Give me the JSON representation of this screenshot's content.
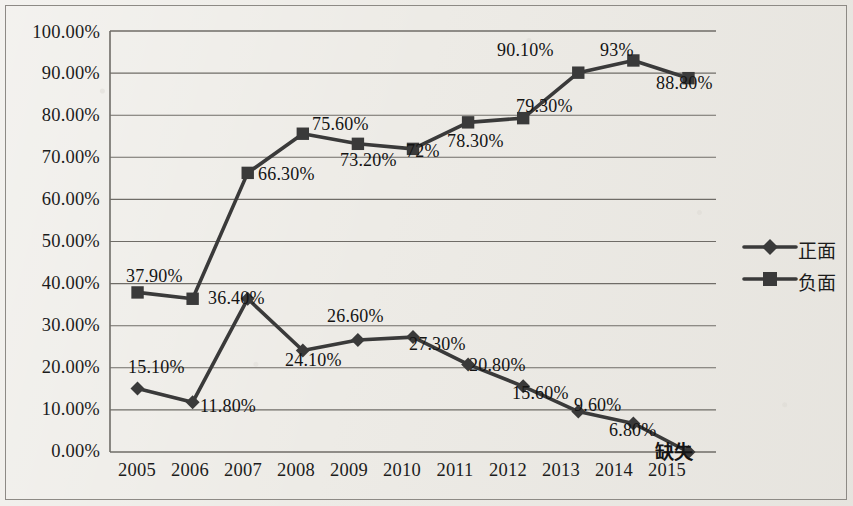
{
  "chart_data": {
    "type": "line",
    "title": "",
    "subtitle": "",
    "xlabel": "",
    "ylabel": "",
    "categories": [
      "2005",
      "2006",
      "2007",
      "2008",
      "2009",
      "2010",
      "2011",
      "2012",
      "2013",
      "2014",
      "2015"
    ],
    "ylim": [
      0,
      100
    ],
    "ytick_labels": [
      "0.00%",
      "10.00%",
      "20.00%",
      "30.00%",
      "40.00%",
      "50.00%",
      "60.00%",
      "70.00%",
      "80.00%",
      "90.00%",
      "100.00%"
    ],
    "ytick_values": [
      0,
      10,
      20,
      30,
      40,
      50,
      60,
      70,
      80,
      90,
      100
    ],
    "grid": "horizontal",
    "legend_position": "right",
    "series": [
      {
        "name": "正面",
        "marker": "diamond",
        "color": "#3a3a3a",
        "values": [
          15.1,
          11.8,
          36.4,
          24.1,
          26.6,
          27.3,
          20.8,
          15.6,
          9.6,
          6.8,
          0
        ],
        "point_labels": [
          "15.10%",
          "11.80%",
          "36.40%",
          "24.10%",
          "26.60%",
          "27.30%",
          "20.80%",
          "15.60%",
          "9.60%",
          "6.80%",
          "缺失"
        ]
      },
      {
        "name": "负面",
        "marker": "square",
        "color": "#3a3a3a",
        "values": [
          37.9,
          36.4,
          66.3,
          75.6,
          73.2,
          72.0,
          78.3,
          79.3,
          90.1,
          93.0,
          88.8
        ],
        "point_labels": [
          "37.90%",
          "",
          "66.30%",
          "75.60%",
          "73.20%",
          "72%",
          "78.30%",
          "79.30%",
          "90.10%",
          "93%",
          "88.80%"
        ]
      }
    ]
  },
  "legend": {
    "items": [
      {
        "label": "正面",
        "marker": "diamond"
      },
      {
        "label": "负面",
        "marker": "square"
      }
    ]
  },
  "label_positions": {
    "positive": [
      {
        "text": "15.10%",
        "x": 128,
        "y": 357
      },
      {
        "text": "11.80%",
        "x": 200,
        "y": 396
      },
      {
        "text": "36.40%",
        "x": 208,
        "y": 288
      },
      {
        "text": "24.10%",
        "x": 285,
        "y": 350
      },
      {
        "text": "26.60%",
        "x": 327,
        "y": 306
      },
      {
        "text": "27.30%",
        "x": 409,
        "y": 334
      },
      {
        "text": "20.80%",
        "x": 469,
        "y": 355
      },
      {
        "text": "15.60%",
        "x": 512,
        "y": 383
      },
      {
        "text": "9.60%",
        "x": 574,
        "y": 395
      },
      {
        "text": "6.80%",
        "x": 609,
        "y": 420
      },
      {
        "text": "缺失",
        "x": 655,
        "y": 437
      }
    ],
    "negative": [
      {
        "text": "37.90%",
        "x": 126,
        "y": 266
      },
      {
        "text": "66.30%",
        "x": 258,
        "y": 164
      },
      {
        "text": "75.60%",
        "x": 312,
        "y": 114
      },
      {
        "text": "73.20%",
        "x": 340,
        "y": 150
      },
      {
        "text": "72%",
        "x": 406,
        "y": 141
      },
      {
        "text": "78.30%",
        "x": 447,
        "y": 131
      },
      {
        "text": "79.30%",
        "x": 516,
        "y": 96
      },
      {
        "text": "90.10%",
        "x": 497,
        "y": 40
      },
      {
        "text": "93%",
        "x": 600,
        "y": 40
      },
      {
        "text": "88.80%",
        "x": 656,
        "y": 73
      }
    ]
  }
}
